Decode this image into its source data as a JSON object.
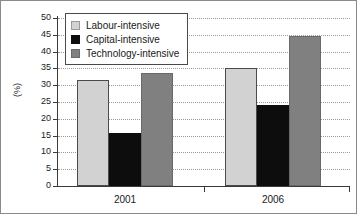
{
  "chart_data": {
    "type": "bar",
    "title": "",
    "xlabel": "",
    "ylabel": "(%)",
    "categories": [
      "2001",
      "2006"
    ],
    "series": [
      {
        "name": "Labour-intensive",
        "values": [
          31.5,
          35.2
        ],
        "color": "#d2d2d2"
      },
      {
        "name": "Capital-intensive",
        "values": [
          15.8,
          24.1
        ],
        "color": "#0d0d0d"
      },
      {
        "name": "Technology-intensive",
        "values": [
          33.5,
          44.5
        ],
        "color": "#808080"
      }
    ],
    "ylim": [
      0,
      50
    ],
    "ytick_labels": [
      "50",
      "45",
      "40",
      "35",
      "30",
      "25",
      "20",
      "15",
      "10",
      "5",
      "0"
    ],
    "ytick_values": [
      50,
      45,
      40,
      35,
      30,
      25,
      20,
      15,
      10,
      5,
      0
    ],
    "grid": true,
    "grid_style": "dotted-horizontal",
    "legend_position": "upper-left-inside"
  }
}
